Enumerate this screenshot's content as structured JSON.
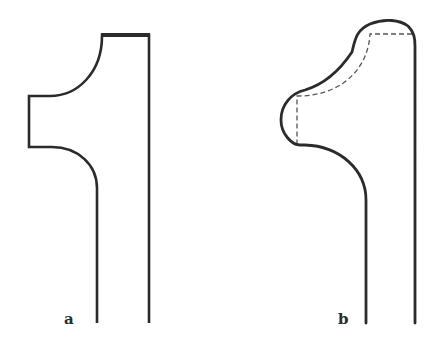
{
  "figure": {
    "panels": [
      {
        "id": "a",
        "label": "a",
        "description": "Glyph outline of numeral one with straight sharp corners and concave quarter-round curves",
        "stroke_color": "#2b2b2b"
      },
      {
        "id": "b",
        "label": "b",
        "description": "Same numeral one outline with rounded/softened corners; original outline shown dashed",
        "stroke_color": "#2b2b2b",
        "dashed_overlay_color": "#555555"
      }
    ]
  }
}
